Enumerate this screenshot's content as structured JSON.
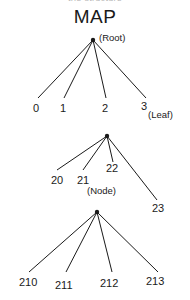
{
  "page": {
    "clipped_header_text": "trie structure",
    "title": "MAP",
    "background_color": "#ffffff",
    "line_color": "#1a1a1a",
    "text_color": "#1a1a1a"
  },
  "annotations": {
    "root": "(Root)",
    "leaf": "(Leaf)",
    "node": "(Node)"
  },
  "levels": [
    {
      "name": "level-1",
      "labels": [
        "0",
        "1",
        "2",
        "3"
      ]
    },
    {
      "name": "level-2",
      "labels": [
        "20",
        "21",
        "22",
        "23"
      ]
    },
    {
      "name": "level-3",
      "labels": [
        "210",
        "211",
        "212",
        "213"
      ]
    }
  ]
}
